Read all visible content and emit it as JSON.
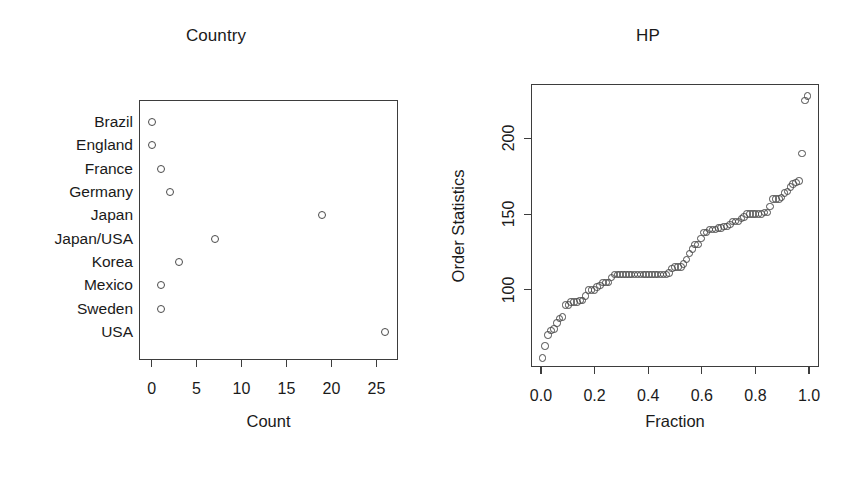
{
  "figure": {
    "background": "#ffffff",
    "point_color": "#4a4a4a",
    "axis_color": "#3d3d3d",
    "text_color": "#1a1a1a"
  },
  "chart_data": [
    {
      "type": "scatter",
      "panel_id": "country",
      "title": "Country",
      "xlabel": "Count",
      "ylabel": "",
      "grid": false,
      "legend": "none",
      "orientation": "horizontal-dotchart",
      "xlim": [
        -1.4,
        27.4
      ],
      "xticks": [
        0,
        5,
        10,
        15,
        20,
        25
      ],
      "xticklabels": [
        "0",
        "5",
        "10",
        "15",
        "20",
        "25"
      ],
      "categories": [
        "Brazil",
        "England",
        "France",
        "Germany",
        "Japan",
        "Japan/USA",
        "Korea",
        "Mexico",
        "Sweden",
        "USA"
      ],
      "values": [
        0,
        0,
        1,
        2,
        19,
        7,
        3,
        1,
        1,
        26
      ],
      "points": [
        {
          "label": "Brazil",
          "count": 0
        },
        {
          "label": "England",
          "count": 0
        },
        {
          "label": "France",
          "count": 1
        },
        {
          "label": "Germany",
          "count": 2
        },
        {
          "label": "Japan",
          "count": 19
        },
        {
          "label": "Japan/USA",
          "count": 7
        },
        {
          "label": "Korea",
          "count": 3
        },
        {
          "label": "Mexico",
          "count": 1
        },
        {
          "label": "Sweden",
          "count": 1
        },
        {
          "label": "USA",
          "count": 26
        }
      ]
    },
    {
      "type": "scatter",
      "panel_id": "hp",
      "title": "HP",
      "xlabel": "Fraction",
      "ylabel": "Order Statistics",
      "grid": false,
      "legend": "none",
      "xlim": [
        -0.037,
        1.037
      ],
      "ylim": [
        49,
        236
      ],
      "xticks": [
        0.0,
        0.2,
        0.4,
        0.6,
        0.8,
        1.0
      ],
      "xticklabels": [
        "0.0",
        "0.2",
        "0.4",
        "0.6",
        "0.8",
        "1.0"
      ],
      "yticks": [
        100,
        150,
        200
      ],
      "yticklabels": [
        "100",
        "150",
        "200"
      ],
      "n": 93,
      "x": [
        0.0054,
        0.0161,
        0.0269,
        0.0376,
        0.0484,
        0.0591,
        0.0699,
        0.0806,
        0.0914,
        0.1022,
        0.1129,
        0.1237,
        0.1344,
        0.1452,
        0.1559,
        0.1667,
        0.1774,
        0.1882,
        0.1989,
        0.2097,
        0.2204,
        0.2312,
        0.2419,
        0.2527,
        0.2634,
        0.2742,
        0.2849,
        0.2957,
        0.3065,
        0.3172,
        0.328,
        0.3387,
        0.3495,
        0.3602,
        0.371,
        0.3817,
        0.3925,
        0.4032,
        0.414,
        0.4247,
        0.4355,
        0.4462,
        0.457,
        0.4677,
        0.4785,
        0.4892,
        0.5,
        0.5108,
        0.5215,
        0.5323,
        0.543,
        0.5538,
        0.5645,
        0.5753,
        0.586,
        0.5968,
        0.6075,
        0.6183,
        0.629,
        0.6398,
        0.6505,
        0.6613,
        0.672,
        0.6828,
        0.6935,
        0.7043,
        0.7151,
        0.7258,
        0.7366,
        0.7473,
        0.7581,
        0.7688,
        0.7796,
        0.7903,
        0.8011,
        0.8118,
        0.8226,
        0.8333,
        0.8441,
        0.8548,
        0.8656,
        0.8763,
        0.8871,
        0.8978,
        0.9086,
        0.9194,
        0.9301,
        0.9409,
        0.9516,
        0.9624,
        0.9731,
        0.9839,
        0.9946
      ],
      "y": [
        55,
        63,
        70,
        73,
        74,
        78,
        81,
        82,
        90,
        90,
        92,
        92,
        92,
        93,
        93,
        96,
        100,
        100,
        100,
        102,
        103,
        105,
        105,
        105,
        108,
        110,
        110,
        110,
        110,
        110,
        110,
        110,
        110,
        110,
        110,
        110,
        110,
        110,
        110,
        110,
        110,
        110,
        110,
        110,
        111,
        114,
        115,
        115,
        115,
        117,
        120,
        124,
        127,
        130,
        130,
        134,
        138,
        138,
        140,
        140,
        140,
        141,
        141,
        142,
        142,
        143,
        145,
        145,
        145,
        147,
        148,
        150,
        150,
        150,
        150,
        150,
        150,
        151,
        151,
        155,
        160,
        160,
        160,
        161,
        164,
        165,
        168,
        170,
        171,
        172,
        190,
        225,
        228
      ]
    }
  ]
}
